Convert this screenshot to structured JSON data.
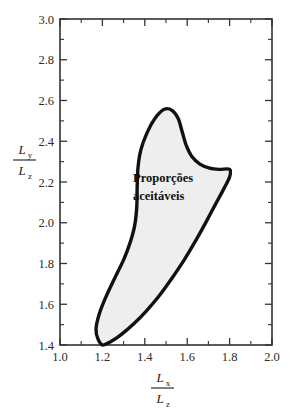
{
  "chart_data": {
    "type": "area",
    "title": "",
    "subtitle": "",
    "xlabel": "Lx / Lz",
    "ylabel": "Ly / Lz",
    "xlim": [
      1.0,
      2.0
    ],
    "ylim": [
      1.4,
      3.0
    ],
    "grid": false,
    "legend_position": "none",
    "x_ticks": [
      1.0,
      1.2,
      1.4,
      1.6,
      1.8,
      2.0
    ],
    "x_tick_labels": [
      "1.0",
      "1.2",
      "1.4",
      "1.6",
      "1.8",
      "2.0"
    ],
    "x_minor_ticks": [
      1.1,
      1.3,
      1.5,
      1.7,
      1.9
    ],
    "y_ticks": [
      1.4,
      1.6,
      1.8,
      2.0,
      2.2,
      2.4,
      2.6,
      2.8,
      3.0
    ],
    "y_tick_labels": [
      "1.4",
      "1.6",
      "1.8",
      "2.0",
      "2.2",
      "2.4",
      "2.6",
      "2.8",
      "3.0"
    ],
    "y_minor_ticks": [
      1.5,
      1.7,
      1.9,
      2.1,
      2.3,
      2.5,
      2.7,
      2.9
    ],
    "annotations": [
      {
        "name": "acceptable-region-label",
        "line1": "Proporções",
        "line2": "aceitáveis",
        "x": 1.46,
        "y": 2.17
      }
    ],
    "series": [
      {
        "name": "Proporções aceitáveis",
        "type": "closed-region",
        "fill_color": "#eeeeee",
        "line_color": "#111111",
        "points": [
          [
            1.2,
            1.4
          ],
          [
            1.178,
            1.432
          ],
          [
            1.17,
            1.478
          ],
          [
            1.183,
            1.545
          ],
          [
            1.212,
            1.625
          ],
          [
            1.258,
            1.728
          ],
          [
            1.3,
            1.818
          ],
          [
            1.33,
            1.9
          ],
          [
            1.352,
            1.985
          ],
          [
            1.362,
            2.075
          ],
          [
            1.364,
            2.175
          ],
          [
            1.368,
            2.272
          ],
          [
            1.382,
            2.36
          ],
          [
            1.412,
            2.445
          ],
          [
            1.45,
            2.515
          ],
          [
            1.492,
            2.557
          ],
          [
            1.528,
            2.552
          ],
          [
            1.558,
            2.51
          ],
          [
            1.578,
            2.44
          ],
          [
            1.596,
            2.378
          ],
          [
            1.622,
            2.325
          ],
          [
            1.66,
            2.288
          ],
          [
            1.706,
            2.268
          ],
          [
            1.752,
            2.262
          ],
          [
            1.8,
            2.262
          ],
          [
            1.8,
            2.225
          ],
          [
            1.772,
            2.165
          ],
          [
            1.732,
            2.088
          ],
          [
            1.688,
            2.002
          ],
          [
            1.64,
            1.912
          ],
          [
            1.586,
            1.818
          ],
          [
            1.528,
            1.728
          ],
          [
            1.468,
            1.642
          ],
          [
            1.408,
            1.568
          ],
          [
            1.348,
            1.504
          ],
          [
            1.29,
            1.452
          ],
          [
            1.242,
            1.418
          ],
          [
            1.2,
            1.4
          ]
        ]
      }
    ]
  },
  "axis_labels": {
    "y_numerator": "L",
    "y_numerator_sub": "y",
    "y_denominator": "L",
    "y_denominator_sub": "z",
    "x_numerator": "L",
    "x_numerator_sub": "x",
    "x_denominator": "L",
    "x_denominator_sub": "z"
  },
  "colors": {
    "region_fill": "#eeeeee",
    "region_stroke": "#111111",
    "frame": "#333333",
    "text": "#1a1a1a"
  }
}
